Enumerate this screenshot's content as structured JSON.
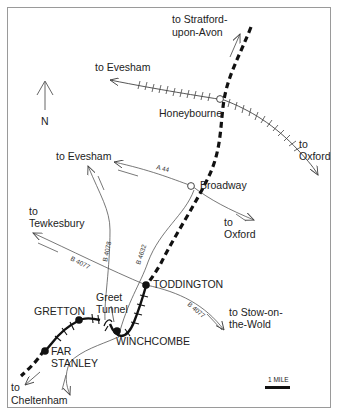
{
  "map": {
    "title": "",
    "colors": {
      "background": "#ffffff",
      "ink": "#222222",
      "frame": "#999999",
      "line": "#555555"
    },
    "north_arrow": {
      "label": "N"
    },
    "scale_bar": {
      "label": "1 MILE"
    },
    "stations": [
      {
        "name": "TODDINGTON",
        "type": "open"
      },
      {
        "name": "WINCHCOMBE",
        "type": "open"
      },
      {
        "name": "GRETTON",
        "type": "open"
      },
      {
        "name": "FAR STANLEY",
        "line1": "FAR",
        "line2": "STANLEY",
        "type": "open"
      }
    ],
    "towns": [
      {
        "name": "Honeybourne",
        "type": "closed-station"
      },
      {
        "name": "Broadway",
        "type": "closed-station"
      }
    ],
    "features": [
      {
        "name": "Greet Tunnel",
        "line1": "Greet",
        "line2": "Tunnel"
      }
    ],
    "roads": [
      {
        "id": "A 44"
      },
      {
        "id": "B 4078"
      },
      {
        "id": "B 4632"
      },
      {
        "id": "B 4077 west",
        "label": "B 4077"
      },
      {
        "id": "B 4077 east",
        "label": "B 4077"
      }
    ],
    "destinations": {
      "stratford": {
        "line1": "to Stratford-",
        "line2": "upon-Avon"
      },
      "evesham_rail": {
        "label": "to Evesham"
      },
      "oxford_rail": {
        "line1": "to",
        "line2": "Oxford"
      },
      "evesham_road": {
        "label": "to Evesham"
      },
      "oxford_road": {
        "line1": "to",
        "line2": "Oxford"
      },
      "tewkesbury": {
        "line1": "to",
        "line2": "Tewkesbury"
      },
      "stow": {
        "line1": "to Stow-on-",
        "line2": "the-Wold"
      },
      "cheltenham": {
        "line1": "to",
        "line2": "Cheltenham"
      }
    }
  }
}
